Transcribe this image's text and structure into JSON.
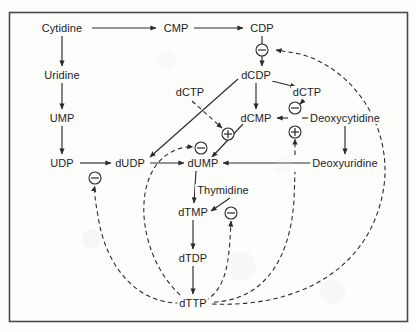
{
  "figure": {
    "border_color": "#4a4a4a",
    "line_color": "#2b2b2b",
    "text_color": "#1c1c1c",
    "background_color": "#fdfdfc"
  },
  "nodes": [
    {
      "id": "cytidine",
      "label": "Cytidine",
      "x": 62,
      "y": 28
    },
    {
      "id": "cmp",
      "label": "CMP",
      "x": 176,
      "y": 28
    },
    {
      "id": "cdp",
      "label": "CDP",
      "x": 262,
      "y": 28
    },
    {
      "id": "uridine",
      "label": "Uridine",
      "x": 62,
      "y": 75
    },
    {
      "id": "ump",
      "label": "UMP",
      "x": 62,
      "y": 118
    },
    {
      "id": "udp",
      "label": "UDP",
      "x": 62,
      "y": 163
    },
    {
      "id": "dcdp",
      "label": "dCDP",
      "x": 256,
      "y": 75
    },
    {
      "id": "dctp_left",
      "label": "dCTP",
      "x": 190,
      "y": 92
    },
    {
      "id": "dctp_right",
      "label": "dCTP",
      "x": 307,
      "y": 92
    },
    {
      "id": "dcmp",
      "label": "dCMP",
      "x": 256,
      "y": 118
    },
    {
      "id": "deoxycytidine",
      "label": "Deoxycytidine",
      "x": 345,
      "y": 118
    },
    {
      "id": "dudp",
      "label": "dUDP",
      "x": 130,
      "y": 163
    },
    {
      "id": "dump",
      "label": "dUMP",
      "x": 203,
      "y": 163
    },
    {
      "id": "deoxyuridine",
      "label": "Deoxyuridine",
      "x": 345,
      "y": 163
    },
    {
      "id": "thymidine",
      "label": "Thymidine",
      "x": 223,
      "y": 190
    },
    {
      "id": "dtmp",
      "label": "dTMP",
      "x": 193,
      "y": 212
    },
    {
      "id": "dtdp",
      "label": "dTDP",
      "x": 193,
      "y": 258
    },
    {
      "id": "dttp",
      "label": "dTTP",
      "x": 193,
      "y": 303
    }
  ],
  "regulation_signs": [
    {
      "id": "sign-cdp-inhibit",
      "sign": "minus",
      "x": 262,
      "y": 50,
      "description": "dTTP inhibits CDP to dCDP"
    },
    {
      "id": "sign-dcmp-inhibit",
      "sign": "minus",
      "x": 295,
      "y": 108,
      "description": "dCTP inhibits deoxycytidine to dCMP"
    },
    {
      "id": "sign-dcmp-activate",
      "sign": "plus",
      "x": 295,
      "y": 132,
      "description": "deoxyuridine activates dCMP"
    },
    {
      "id": "sign-dump-activate",
      "sign": "plus",
      "x": 228,
      "y": 134,
      "description": "dCTP activates dCMP to dUMP"
    },
    {
      "id": "sign-dump-inhibit",
      "sign": "minus",
      "x": 201,
      "y": 148,
      "description": "dTTP inhibits conversion to dUMP"
    },
    {
      "id": "sign-dudp-inhibit",
      "sign": "minus",
      "x": 95,
      "y": 178,
      "description": "dTTP inhibits UDP to dUDP"
    },
    {
      "id": "sign-dtmp-inhibit",
      "sign": "minus",
      "x": 231,
      "y": 213,
      "description": "dTTP inhibits thymidine to dTMP"
    }
  ],
  "solid_arrows": [
    {
      "from": "Cytidine",
      "to": "CMP"
    },
    {
      "from": "CMP",
      "to": "CDP"
    },
    {
      "from": "Cytidine",
      "to": "Uridine"
    },
    {
      "from": "Uridine",
      "to": "UMP"
    },
    {
      "from": "UMP",
      "to": "UDP"
    },
    {
      "from": "CDP",
      "to": "dCDP"
    },
    {
      "from": "dCDP",
      "to": "dCTP (right)"
    },
    {
      "from": "dCDP",
      "to": "dCMP"
    },
    {
      "from": "dCDP",
      "to": "dUDP"
    },
    {
      "from": "dCMP",
      "to": "dUMP"
    },
    {
      "from": "UDP",
      "to": "dUDP"
    },
    {
      "from": "dUDP",
      "to": "dUMP"
    },
    {
      "from": "Deoxycytidine",
      "to": "dCMP"
    },
    {
      "from": "Deoxyuridine",
      "to": "dUMP"
    },
    {
      "from": "Deoxycytidine",
      "to": "Deoxyuridine"
    },
    {
      "from": "dUMP",
      "to": "dTMP"
    },
    {
      "from": "Thymidine",
      "to": "dTMP"
    },
    {
      "from": "dTMP",
      "to": "dTDP"
    },
    {
      "from": "dTDP",
      "to": "dTTP"
    }
  ],
  "dashed_feedback_arrows": [
    {
      "from": "dTTP",
      "to": "CDP to dCDP step",
      "sign": "minus"
    },
    {
      "from": "dCTP (left)",
      "to": "dCMP to dUMP step",
      "sign": "plus"
    },
    {
      "from": "dCTP (right)",
      "to": "deoxycytidine to dCMP step",
      "sign": "minus"
    },
    {
      "from": "Deoxyuridine",
      "to": "deoxycytidine to dCMP step",
      "sign": "plus"
    },
    {
      "from": "dTTP",
      "to": "dUDP to dUMP step",
      "sign": "minus"
    },
    {
      "from": "dTTP",
      "to": "UDP to dUDP step",
      "sign": "minus"
    },
    {
      "from": "dTTP",
      "to": "thymidine to dTMP step",
      "sign": "minus"
    }
  ]
}
